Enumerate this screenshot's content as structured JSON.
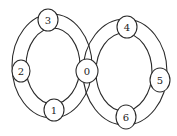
{
  "diagram": {
    "type": "figure-eight ring graph",
    "loops": [
      {
        "name": "left-loop",
        "nodes": [
          "0",
          "1",
          "2",
          "3"
        ]
      },
      {
        "name": "right-loop",
        "nodes": [
          "0",
          "4",
          "5",
          "6"
        ]
      }
    ],
    "nodes": [
      {
        "id": "0",
        "label": "0"
      },
      {
        "id": "1",
        "label": "1"
      },
      {
        "id": "2",
        "label": "2"
      },
      {
        "id": "3",
        "label": "3"
      },
      {
        "id": "4",
        "label": "4"
      },
      {
        "id": "5",
        "label": "5"
      },
      {
        "id": "6",
        "label": "6"
      }
    ],
    "colors": {
      "stroke": "#2a2a2a",
      "background": "#ffffff"
    }
  }
}
